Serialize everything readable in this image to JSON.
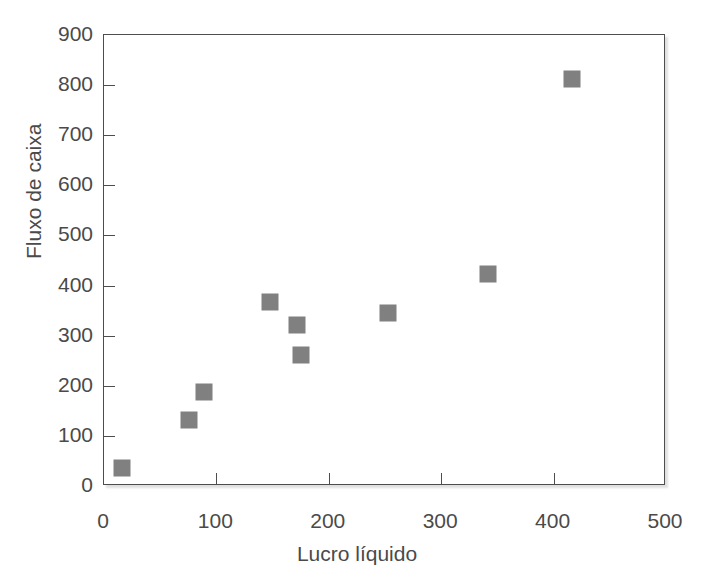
{
  "chart_data": {
    "type": "scatter",
    "title": "",
    "xlabel": "Lucro líquido",
    "ylabel": "Fluxo de caixa",
    "xlim": [
      0,
      500
    ],
    "ylim": [
      0,
      900
    ],
    "xticks": [
      0,
      100,
      200,
      300,
      400,
      500
    ],
    "yticks": [
      0,
      100,
      200,
      300,
      400,
      500,
      600,
      700,
      800,
      900
    ],
    "xtick_labels": [
      "0",
      "100",
      "200",
      "300",
      "400",
      "500"
    ],
    "ytick_labels": [
      "0",
      "100",
      "200",
      "300",
      "400",
      "500",
      "600",
      "700",
      "800",
      "900"
    ],
    "grid": false,
    "legend": false,
    "marker": "square",
    "marker_color": "#808080",
    "marker_size": 17,
    "points": [
      {
        "x": 16,
        "y": 36
      },
      {
        "x": 76,
        "y": 132
      },
      {
        "x": 89,
        "y": 188
      },
      {
        "x": 148,
        "y": 368
      },
      {
        "x": 172,
        "y": 322
      },
      {
        "x": 175,
        "y": 262
      },
      {
        "x": 253,
        "y": 346
      },
      {
        "x": 342,
        "y": 424
      },
      {
        "x": 416,
        "y": 812
      }
    ]
  },
  "style": {
    "background": "#ffffff",
    "frame_color": "#4d4d4d",
    "text_color": "#4a4a4a"
  }
}
